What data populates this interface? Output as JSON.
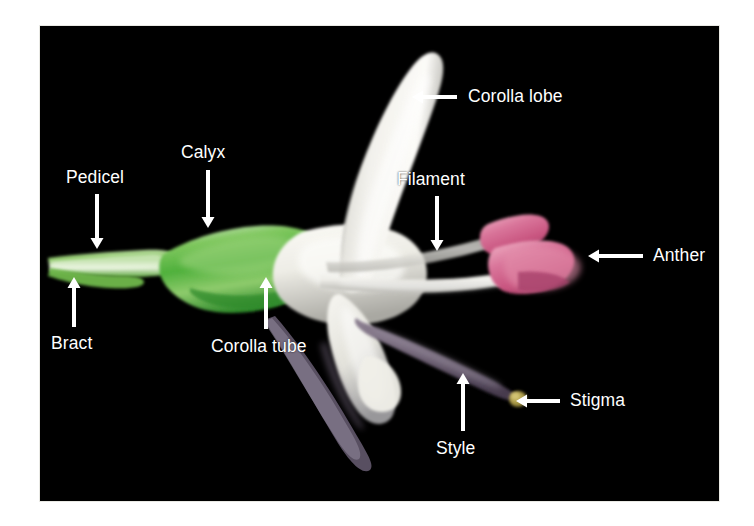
{
  "figure": {
    "kind": "botanical-anatomy-photograph",
    "background_color": "#000000",
    "page_color": "#ffffff",
    "label_color": "#ffffff",
    "arrow_color": "#ffffff",
    "photo": {
      "left": 40,
      "top": 26,
      "width": 679,
      "height": 475
    }
  },
  "specimen_colors": {
    "pedicel_green": "#7fbf5a",
    "calyx_green": "#5cb84a",
    "calyx_green_dark": "#3f9437",
    "corolla_white": "#f4f3ee",
    "corolla_shadow": "#b9b8b2",
    "anther_pink": "#d4698c",
    "anther_pink_light": "#e89bb4",
    "filament_white": "#ddddd6",
    "style_purple": "#6d5f72",
    "style_purple_dark": "#4a3f52",
    "stigma_olive": "#a89b4a"
  },
  "labels": [
    {
      "id": "corolla-lobe",
      "text": "Corolla lobe",
      "text_x": 468,
      "text_y": 88,
      "arrow": {
        "x1": 457,
        "y1": 97,
        "x2": 412,
        "y2": 97,
        "direction": "left"
      }
    },
    {
      "id": "pedicel",
      "text": "Pedicel",
      "text_x": 66,
      "text_y": 169,
      "arrow": {
        "x1": 97,
        "y1": 194,
        "x2": 97,
        "y2": 249,
        "direction": "down"
      }
    },
    {
      "id": "calyx",
      "text": "Calyx",
      "text_x": 181,
      "text_y": 144,
      "arrow": {
        "x1": 208,
        "y1": 170,
        "x2": 208,
        "y2": 228,
        "direction": "down"
      }
    },
    {
      "id": "filament",
      "text": "Filament",
      "text_x": 397,
      "text_y": 171,
      "arrow": {
        "x1": 437,
        "y1": 196,
        "x2": 437,
        "y2": 251,
        "direction": "down"
      }
    },
    {
      "id": "anther",
      "text": "Anther",
      "text_x": 653,
      "text_y": 247,
      "arrow": {
        "x1": 643,
        "y1": 256,
        "x2": 588,
        "y2": 256,
        "direction": "left"
      }
    },
    {
      "id": "bract",
      "text": "Bract",
      "text_x": 51,
      "text_y": 335,
      "arrow": {
        "x1": 74,
        "y1": 327,
        "x2": 74,
        "y2": 277,
        "direction": "up"
      }
    },
    {
      "id": "corolla-tube",
      "text": "Corolla tube",
      "text_x": 211,
      "text_y": 338,
      "arrow": {
        "x1": 266,
        "y1": 329,
        "x2": 266,
        "y2": 277,
        "direction": "up"
      }
    },
    {
      "id": "style",
      "text": "Style",
      "text_x": 436,
      "text_y": 440,
      "arrow": {
        "x1": 463,
        "y1": 431,
        "x2": 463,
        "y2": 373,
        "direction": "up"
      }
    },
    {
      "id": "stigma",
      "text": "Stigma",
      "text_x": 570,
      "text_y": 392,
      "arrow": {
        "x1": 560,
        "y1": 401,
        "x2": 516,
        "y2": 401,
        "direction": "left"
      }
    }
  ]
}
